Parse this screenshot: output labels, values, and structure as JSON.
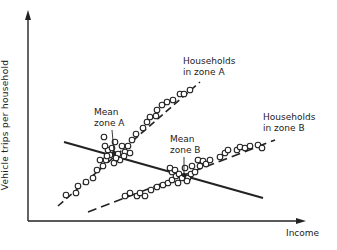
{
  "figure": {
    "y_axis_label": "Vehicle trips per household",
    "x_axis_label": "Income",
    "labels": {
      "households_zone_a": [
        "Households",
        "in zone A"
      ],
      "households_zone_b": [
        "Households",
        "in zone B"
      ],
      "mean_zone_a": [
        "Mean",
        "zone A"
      ],
      "mean_zone_b": [
        "Mean",
        "zone B"
      ]
    },
    "colors": {
      "ink": "#222222",
      "background": "#ffffff"
    }
  },
  "chart_data": {
    "type": "scatter",
    "title": "",
    "xlabel": "Income",
    "ylabel": "Vehicle trips per household",
    "grid": false,
    "axis_ticks": "none",
    "series": [
      {
        "name": "Households in zone A",
        "trend": "dashed line, steep positive slope",
        "line_px": [
          [
            58,
            206
          ],
          [
            200,
            82
          ]
        ],
        "points_px": [
          [
            66,
            195
          ],
          [
            76,
            193
          ],
          [
            78,
            186
          ],
          [
            86,
            182
          ],
          [
            93,
            178
          ],
          [
            97,
            170
          ],
          [
            103,
            166
          ],
          [
            106,
            160
          ],
          [
            110,
            155
          ],
          [
            108,
            150
          ],
          [
            105,
            146
          ],
          [
            104,
            137
          ],
          [
            112,
            148
          ],
          [
            115,
            142
          ],
          [
            118,
            154
          ],
          [
            122,
            146
          ],
          [
            125,
            152
          ],
          [
            120,
            160
          ],
          [
            114,
            163
          ],
          [
            107,
            156
          ],
          [
            128,
            146
          ],
          [
            132,
            140
          ],
          [
            136,
            134
          ],
          [
            143,
            128
          ],
          [
            147,
            122
          ],
          [
            150,
            117
          ],
          [
            156,
            116
          ],
          [
            157,
            110
          ],
          [
            162,
            105
          ],
          [
            167,
            102
          ],
          [
            173,
            100
          ],
          [
            180,
            94
          ],
          [
            184,
            94
          ],
          [
            190,
            90
          ],
          [
            124,
            156
          ],
          [
            130,
            153
          ],
          [
            116,
            158
          ],
          [
            100,
            160
          ]
        ]
      },
      {
        "name": "Households in zone B",
        "trend": "dashed line, gentle positive slope",
        "line_px": [
          [
            88,
            212
          ],
          [
            275,
            140
          ]
        ],
        "points_px": [
          [
            125,
            196
          ],
          [
            130,
            193
          ],
          [
            137,
            196
          ],
          [
            140,
            193
          ],
          [
            145,
            196
          ],
          [
            151,
            190
          ],
          [
            157,
            187
          ],
          [
            163,
            185
          ],
          [
            168,
            183
          ],
          [
            172,
            180
          ],
          [
            176,
            176
          ],
          [
            172,
            172
          ],
          [
            170,
            168
          ],
          [
            175,
            170
          ],
          [
            179,
            174
          ],
          [
            182,
            178
          ],
          [
            188,
            178
          ],
          [
            191,
            174
          ],
          [
            185,
            168
          ],
          [
            195,
            172
          ],
          [
            192,
            166
          ],
          [
            200,
            166
          ],
          [
            198,
            160
          ],
          [
            203,
            161
          ],
          [
            206,
            164
          ],
          [
            210,
            160
          ],
          [
            220,
            157
          ],
          [
            225,
            153
          ],
          [
            228,
            150
          ],
          [
            237,
            150
          ],
          [
            240,
            147
          ],
          [
            245,
            148
          ],
          [
            250,
            146
          ],
          [
            258,
            145
          ],
          [
            262,
            148
          ],
          [
            178,
            183
          ],
          [
            187,
            181
          ]
        ]
      },
      {
        "name": "Zone means regression",
        "trend": "solid line, negative slope through zone means",
        "line_px": [
          [
            64,
            142
          ],
          [
            263,
            198
          ]
        ]
      }
    ],
    "annotations": [
      {
        "text": "Mean zone A",
        "points_to_px": [
          114,
          153
        ]
      },
      {
        "text": "Mean zone B",
        "points_to_px": [
          184,
          175
        ]
      },
      {
        "text": "Households in zone A",
        "near_px": [
          183,
          62
        ]
      },
      {
        "text": "Households in zone B",
        "near_px": [
          263,
          117
        ]
      }
    ],
    "axes_px": {
      "origin": [
        28,
        221
      ],
      "y_top": [
        28,
        12
      ],
      "x_right": [
        305,
        221
      ]
    }
  }
}
